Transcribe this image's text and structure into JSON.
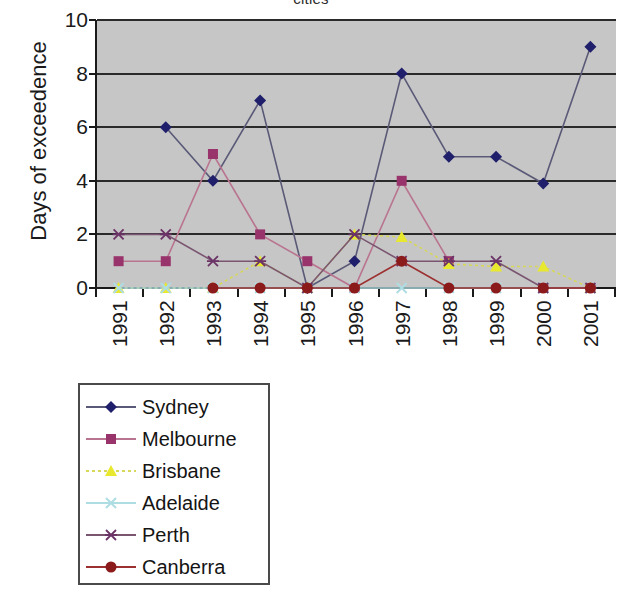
{
  "title": "cities",
  "chart_data": {
    "type": "line",
    "title": "cities",
    "xlabel": "",
    "ylabel": "Days of exceedence",
    "categories": [
      "1991",
      "1992",
      "1993",
      "1994",
      "1995",
      "1996",
      "1997",
      "1998",
      "1999",
      "2000",
      "2001"
    ],
    "x": [
      1991,
      1992,
      1993,
      1994,
      1995,
      1996,
      1997,
      1998,
      1999,
      2000,
      2001
    ],
    "ylim": [
      0,
      10
    ],
    "yticks": [
      0,
      2,
      4,
      6,
      8,
      10
    ],
    "grid": "horizontal",
    "legend_position": "below-left",
    "series": [
      {
        "name": "Sydney",
        "color": "#1f1f6b",
        "line_color": "#5a5a78",
        "marker": "diamond",
        "values": [
          null,
          6,
          4,
          7,
          0,
          1,
          8,
          4.9,
          4.9,
          3.9,
          9
        ]
      },
      {
        "name": "Melbourne",
        "color": "#99336b",
        "line_color": "#b9748f",
        "marker": "square",
        "values": [
          1,
          1,
          5,
          2,
          1,
          0,
          4,
          1,
          null,
          0,
          0
        ]
      },
      {
        "name": "Brisbane",
        "color": "#e8e82e",
        "line_color": "#d7d75a",
        "marker": "triangle",
        "values": [
          0,
          0,
          0,
          1,
          0,
          2,
          1.9,
          0.9,
          0.8,
          0.8,
          0
        ]
      },
      {
        "name": "Adelaide",
        "color": "#aedde3",
        "line_color": "#aedde3",
        "marker": "cross",
        "values": [
          0,
          0,
          0,
          0,
          0,
          0,
          0,
          0,
          0,
          0,
          0
        ]
      },
      {
        "name": "Perth",
        "color": "#6b3366",
        "line_color": "#7a5570",
        "marker": "asterisk",
        "values": [
          2,
          2,
          1,
          1,
          0,
          2,
          1,
          1,
          1,
          0,
          0
        ]
      },
      {
        "name": "Canberra",
        "color": "#8b1a1a",
        "line_color": "#9c3030",
        "marker": "circle",
        "values": [
          null,
          null,
          0,
          0,
          0,
          0,
          1,
          0,
          0,
          0,
          0
        ]
      }
    ]
  },
  "legend": {
    "items": [
      {
        "label": "Sydney"
      },
      {
        "label": "Melbourne"
      },
      {
        "label": "Brisbane"
      },
      {
        "label": "Adelaide"
      },
      {
        "label": "Perth"
      },
      {
        "label": "Canberra"
      }
    ]
  }
}
